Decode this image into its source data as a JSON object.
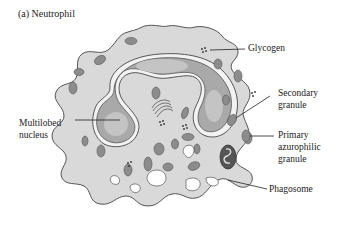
{
  "title": "(a) Neutrophil",
  "labels": {
    "glycogen": "Glycogen",
    "secondary_granule_1": "Secondary",
    "secondary_granule_2": "granule",
    "primary_1": "Primary",
    "primary_2": "azurophilic",
    "primary_3": "granule",
    "phagosome": "Phagosome",
    "nucleus_1": "Multilobed",
    "nucleus_2": "nucleus"
  },
  "colors": {
    "cytoplasm": "#d9d9d9",
    "nucleus": "#a9a9a9",
    "chromatin_light": "#c4c4c4",
    "granule": "#8c8c8c",
    "outline": "#555555"
  }
}
